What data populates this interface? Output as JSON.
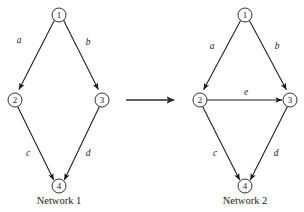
{
  "figure": {
    "background_color": "#ffffff",
    "stroke_color": "#1a1a1a",
    "width": 304,
    "height": 212
  },
  "networks": [
    {
      "id": "network-1",
      "caption": "Network 1",
      "caption_pos": {
        "x": 59,
        "y": 200
      },
      "nodes": [
        {
          "id": "n1",
          "label": "1",
          "x": 59,
          "y": 15,
          "r": 7
        },
        {
          "id": "n2",
          "label": "2",
          "x": 15,
          "y": 100,
          "r": 7
        },
        {
          "id": "n3",
          "label": "3",
          "x": 102,
          "y": 100,
          "r": 7
        },
        {
          "id": "n4",
          "label": "4",
          "x": 59,
          "y": 186,
          "r": 7
        }
      ],
      "edges": [
        {
          "id": "e-a",
          "label": "a",
          "from": "n1",
          "to": "n2",
          "label_x": 19,
          "label_y": 40
        },
        {
          "id": "e-b",
          "label": "b",
          "from": "n1",
          "to": "n3",
          "label_x": 88,
          "label_y": 42
        },
        {
          "id": "e-c",
          "label": "c",
          "from": "n2",
          "to": "n4",
          "label_x": 28,
          "label_y": 153
        },
        {
          "id": "e-d",
          "label": "d",
          "from": "n3",
          "to": "n4",
          "label_x": 88,
          "label_y": 153
        }
      ]
    },
    {
      "id": "network-2",
      "caption": "Network 2",
      "caption_pos": {
        "x": 245,
        "y": 200
      },
      "nodes": [
        {
          "id": "n1",
          "label": "1",
          "x": 245,
          "y": 15,
          "r": 7
        },
        {
          "id": "n2",
          "label": "2",
          "x": 200,
          "y": 100,
          "r": 7
        },
        {
          "id": "n3",
          "label": "3",
          "x": 290,
          "y": 100,
          "r": 7
        },
        {
          "id": "n4",
          "label": "4",
          "x": 245,
          "y": 186,
          "r": 7
        }
      ],
      "edges": [
        {
          "id": "e-a",
          "label": "a",
          "from": "n1",
          "to": "n2",
          "label_x": 212,
          "label_y": 46
        },
        {
          "id": "e-b",
          "label": "b",
          "from": "n1",
          "to": "n3",
          "label_x": 277,
          "label_y": 46
        },
        {
          "id": "e-e",
          "label": "e",
          "from": "n2",
          "to": "n3",
          "label_x": 246,
          "label_y": 92
        },
        {
          "id": "e-c",
          "label": "c",
          "from": "n2",
          "to": "n4",
          "label_x": 215,
          "label_y": 153
        },
        {
          "id": "e-d",
          "label": "d",
          "from": "n3",
          "to": "n4",
          "label_x": 276,
          "label_y": 153
        }
      ]
    }
  ],
  "transform_arrow": {
    "id": "transform-arrow",
    "x1": 126,
    "y1": 100,
    "x2": 174,
    "y2": 100
  },
  "labels": {
    "network1_caption": "Network 1",
    "network2_caption": "Network 2",
    "n1": "1",
    "n2": "2",
    "n3": "3",
    "n4": "4",
    "edge_a": "a",
    "edge_b": "b",
    "edge_c": "c",
    "edge_d": "d",
    "edge_e": "e"
  }
}
